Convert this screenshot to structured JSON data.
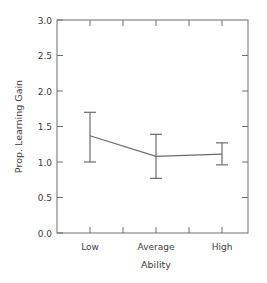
{
  "chart_data": {
    "type": "line",
    "title": "",
    "subtitle": "",
    "xlabel": "Ability",
    "ylabel": "Prop. Learning Gain",
    "categories": [
      "Low",
      "Average",
      "High"
    ],
    "values": [
      1.37,
      1.08,
      1.11
    ],
    "error_low": [
      1.0,
      0.77,
      0.96
    ],
    "error_high": [
      1.7,
      1.39,
      1.27
    ],
    "series": [
      {
        "name": "Prop. Learning Gain",
        "values": [
          1.37,
          1.08,
          1.11
        ],
        "error_low": [
          1.0,
          0.77,
          0.96
        ],
        "error_high": [
          1.7,
          1.39,
          1.27
        ]
      }
    ],
    "ylim": [
      0.0,
      3.0
    ],
    "ytick_values": [
      0.0,
      0.5,
      1.0,
      1.5,
      2.0,
      2.5,
      3.0
    ],
    "ytick_labels": [
      "0.0",
      "0.5",
      "1.0",
      "1.5",
      "2.0",
      "2.5",
      "3.0"
    ],
    "xtick_labels": [
      "Low",
      "Average",
      "High"
    ],
    "xtick_count": 5,
    "grid": false,
    "legend": false,
    "legend_position": "none",
    "error_bar_style": "capped",
    "marker": "none",
    "frame": "box",
    "tick_direction": "in",
    "colors": {
      "line": "#6b6b6b",
      "error_bar": "#6b6b6b",
      "frame": "#6e6e6e",
      "text": "#3c3c3c",
      "background": "#ffffff"
    }
  }
}
